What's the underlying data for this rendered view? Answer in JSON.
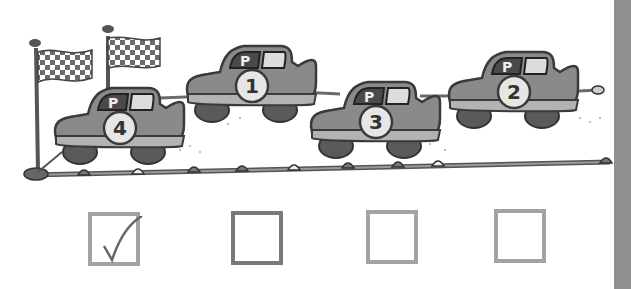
{
  "scene": {
    "description": "Race track with four cars and checkered finish flags",
    "colors": {
      "car_body": "#8a8a8a",
      "car_outline": "#3a3a3a",
      "track": "#7a7a7a",
      "side_bar": "#8f8f8f",
      "box_border": "#a3a3a3",
      "box_border_selected_dark": "#7a7a7a"
    },
    "cars": [
      {
        "number": "4",
        "door_label": "P",
        "position": "leftmost at finish line"
      },
      {
        "number": "1",
        "door_label": "P",
        "position": "second from left, raised"
      },
      {
        "number": "3",
        "door_label": "P",
        "position": "third from left"
      },
      {
        "number": "2",
        "door_label": "P",
        "position": "rightmost"
      }
    ],
    "flags": [
      {
        "type": "checkered"
      },
      {
        "type": "checkered"
      }
    ]
  },
  "answers": [
    {
      "checked": true,
      "mark": "✓"
    },
    {
      "checked": false,
      "mark": ""
    },
    {
      "checked": false,
      "mark": ""
    },
    {
      "checked": false,
      "mark": ""
    }
  ]
}
